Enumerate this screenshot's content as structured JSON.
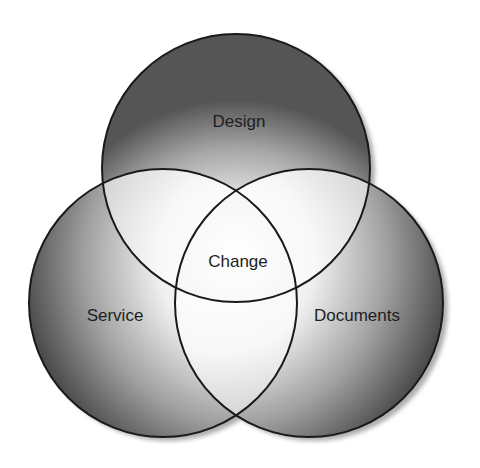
{
  "diagram": {
    "type": "venn",
    "sets": [
      {
        "id": "design",
        "label": "Design"
      },
      {
        "id": "service",
        "label": "Service"
      },
      {
        "id": "documents",
        "label": "Documents"
      }
    ],
    "center_label": "Change",
    "colors": {
      "outline": "#1a1a1a",
      "shade_dark": "#5a5a5a",
      "shade_light": "#ffffff",
      "shadow": "#9a9a9a"
    }
  }
}
